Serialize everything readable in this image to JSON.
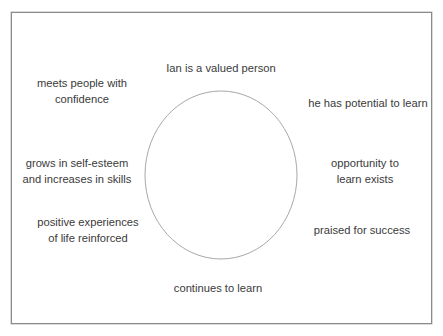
{
  "diagram": {
    "type": "cycle",
    "shape": "ellipse",
    "colors": {
      "frame_border": "#8a8a8a",
      "ellipse_stroke": "#a8a8a8",
      "text": "#3a3a3a",
      "background": "#ffffff"
    },
    "nodes": [
      {
        "id": "top",
        "lines": [
          "Ian is a valued person"
        ]
      },
      {
        "id": "upper-right",
        "lines": [
          "he has potential to learn"
        ]
      },
      {
        "id": "right",
        "lines": [
          "opportunity to",
          "learn exists"
        ]
      },
      {
        "id": "lower-right",
        "lines": [
          "praised for success"
        ]
      },
      {
        "id": "bottom",
        "lines": [
          "continues to learn"
        ]
      },
      {
        "id": "lower-left",
        "lines": [
          "positive experiences",
          "of life reinforced"
        ]
      },
      {
        "id": "left",
        "lines": [
          "grows in self-esteem",
          "and increases in skills"
        ]
      },
      {
        "id": "upper-left",
        "lines": [
          "meets people with",
          "confidence"
        ]
      }
    ]
  }
}
